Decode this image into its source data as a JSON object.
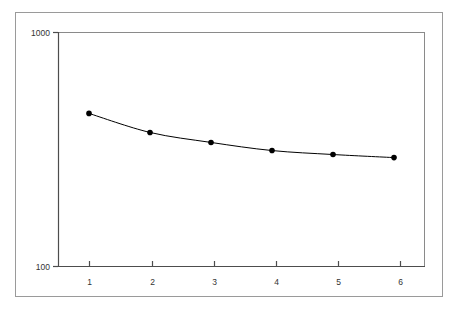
{
  "chart_data": {
    "type": "line",
    "title": "",
    "xlabel": "",
    "ylabel": "",
    "x": [
      1,
      2,
      3,
      4,
      5,
      6
    ],
    "values": [
      451,
      374,
      339,
      313,
      301,
      292
    ],
    "series": [
      {
        "name": "series-1",
        "values": [
          451,
          374,
          339,
          313,
          301,
          292
        ]
      }
    ],
    "xtick_labels": [
      "1",
      "2",
      "3",
      "4",
      "5",
      "6"
    ],
    "ytick_labels": [
      "1000",
      "100"
    ],
    "yscale": "log",
    "ylim": [
      100,
      1000
    ],
    "xlim": [
      0.5,
      6.5
    ],
    "grid": false,
    "legend": false,
    "marker": "filled-circle",
    "line_color": "#000000",
    "marker_color": "#000000",
    "axis_color": "#4d4d4d",
    "frame_color": "#9a9a9a",
    "background_color": "#ffffff"
  },
  "figure": {
    "outer_border_label": "chart-outer-frame",
    "plot_area_label": "plot-area"
  }
}
